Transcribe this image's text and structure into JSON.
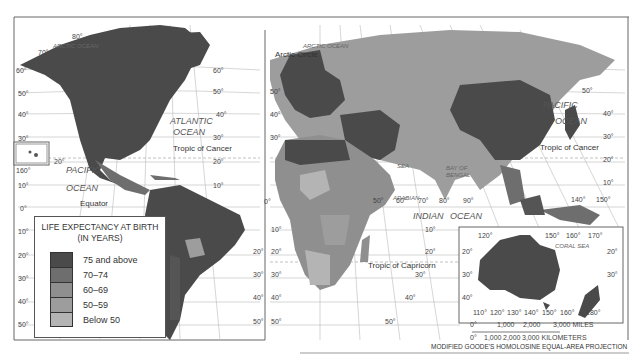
{
  "map": {
    "projection": "MODIFIED GOODE'S HOMOLOSINE EQUAL-AREA PROJECTION",
    "legend": {
      "title_line1": "LIFE EXPECTANCY AT BIRTH",
      "title_line2": "(IN YEARS)",
      "items": [
        {
          "label": "75 and above",
          "color": "#4a4a4a"
        },
        {
          "label": "70–74",
          "color": "#6e6e6e"
        },
        {
          "label": "60–69",
          "color": "#8f8f8f"
        },
        {
          "label": "50–59",
          "color": "#9d9d9d"
        },
        {
          "label": "Below 50",
          "color": "#b4b4b4"
        }
      ]
    },
    "oceans": {
      "arctic_left": "ARCTIC OCEAN",
      "arctic_right": "ARCTIC OCEAN",
      "atlantic_1": "ATLANTIC",
      "atlantic_2": "OCEAN",
      "pacific_left_1": "PACIFIC",
      "pacific_left_2": "OCEAN",
      "pacific_right_1": "PACIFIC",
      "pacific_right_2": "OCEAN",
      "indian": "INDIAN",
      "indian_ocean": "OCEAN",
      "arabian_1": "ARABIAN",
      "arabian_2": "SEA",
      "bengal_1": "BAY OF",
      "bengal_2": "BENGAL",
      "coral": "CORAL SEA"
    },
    "lines": {
      "arctic_circle": "Arctic Circle",
      "tropic_cancer_left": "Tropic of Cancer",
      "tropic_cancer_right": "Tropic of Cancer",
      "equator": "Equator",
      "tropic_capricorn": "Tropic of Capricorn"
    },
    "scale": {
      "miles_0": "0°",
      "miles_1": "1,000",
      "miles_2": "2,000",
      "miles_3": "3,000 MILES",
      "km_0": "0°",
      "km_1": "1,000",
      "km_2": "2,000",
      "km_3": "3,000 KILOMETERS"
    },
    "degrees": {
      "left_lat": [
        "60°",
        "50°",
        "40°",
        "30°",
        "10°",
        "0°",
        "10°",
        "20°",
        "30°",
        "40°",
        "50°"
      ],
      "hawaii": "160°",
      "hawaii_20": "20°",
      "mid_right_lat": [
        "60°",
        "50°",
        "40°",
        "30°",
        "20°",
        "10°"
      ],
      "sa_lat": [
        "20°",
        "30°",
        "40°",
        "50°"
      ],
      "africa_lat_left": [
        "50°",
        "40°",
        "30°"
      ],
      "africa_south": [
        "10°",
        "20°",
        "30°",
        "40°",
        "50°"
      ],
      "indian_lon": [
        "0°",
        "50°",
        "60°",
        "70°",
        "80°",
        "90°"
      ],
      "indian_lat": [
        "10°",
        "20°",
        "30°",
        "40°",
        "50°"
      ],
      "asia_lat": [
        "50°",
        "40°",
        "30°",
        "20°",
        "10°"
      ],
      "asia_lon": [
        "140°",
        "150°"
      ],
      "aus_top": [
        "120°",
        "150°",
        "160°",
        "170°"
      ],
      "aus_lat": [
        "20°",
        "30°",
        "40°"
      ],
      "aus_lat_r": [
        "20°",
        "30°"
      ],
      "aus_bottom": [
        "110°",
        "120°",
        "130°",
        "140°",
        "150°",
        "160°",
        "180°"
      ],
      "arctic_lat": [
        "80°",
        "70°"
      ]
    }
  }
}
